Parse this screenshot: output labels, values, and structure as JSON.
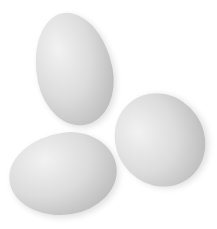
{
  "image": {
    "description": "Three white/grey eggs on a white background",
    "background": "#ffffff",
    "eggs": [
      {
        "name": "top-egg",
        "position": "upper-left",
        "color": "#d8d8d8"
      },
      {
        "name": "right-egg",
        "position": "right",
        "color": "#d8d8d8"
      },
      {
        "name": "bottom-egg",
        "position": "lower-left",
        "color": "#d8d8d8"
      }
    ]
  }
}
